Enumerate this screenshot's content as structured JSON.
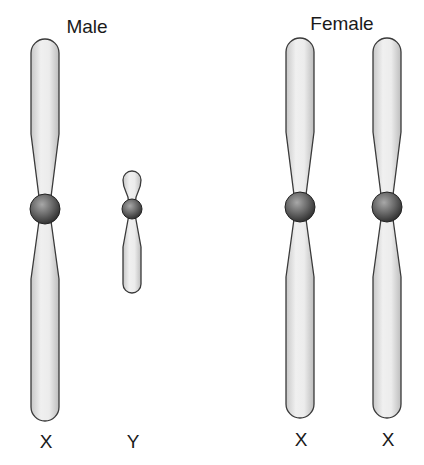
{
  "diagram": {
    "groups": [
      {
        "id": "male",
        "title": "Male",
        "title_x": 87,
        "title_y": 17
      },
      {
        "id": "female",
        "title": "Female",
        "title_x": 342,
        "title_y": 14
      }
    ],
    "chromosomes": [
      {
        "id": "male-x",
        "group": "male",
        "label": "X",
        "type": "X",
        "cx": 45,
        "top": 39,
        "centromere_y": 209,
        "bottom": 421,
        "width": 28,
        "waist": 12,
        "centromere_r": 15,
        "label_y": 432
      },
      {
        "id": "male-y",
        "group": "male",
        "label": "Y",
        "type": "Y",
        "cx": 132,
        "top": 170,
        "centromere_y": 209,
        "bottom": 293,
        "width": 18,
        "waist": 7,
        "centromere_r": 10,
        "label_y": 432
      },
      {
        "id": "female-x1",
        "group": "female",
        "label": "X",
        "type": "X",
        "cx": 300,
        "top": 38,
        "centromere_y": 207,
        "bottom": 418,
        "width": 28,
        "waist": 12,
        "centromere_r": 15,
        "label_y": 430
      },
      {
        "id": "female-x2",
        "group": "female",
        "label": "X",
        "type": "X",
        "cx": 387,
        "top": 38,
        "centromere_y": 207,
        "bottom": 418,
        "width": 28,
        "waist": 12,
        "centromere_r": 15,
        "label_y": 430
      }
    ],
    "colors": {
      "arm_fill_light": "#f2f2f2",
      "arm_fill_dark": "#c4c4c4",
      "arm_stroke": "#3a3a3a",
      "centromere_light": "#9a9a9a",
      "centromere_dark": "#2e2e2e",
      "text": "#1a1a1a"
    }
  }
}
